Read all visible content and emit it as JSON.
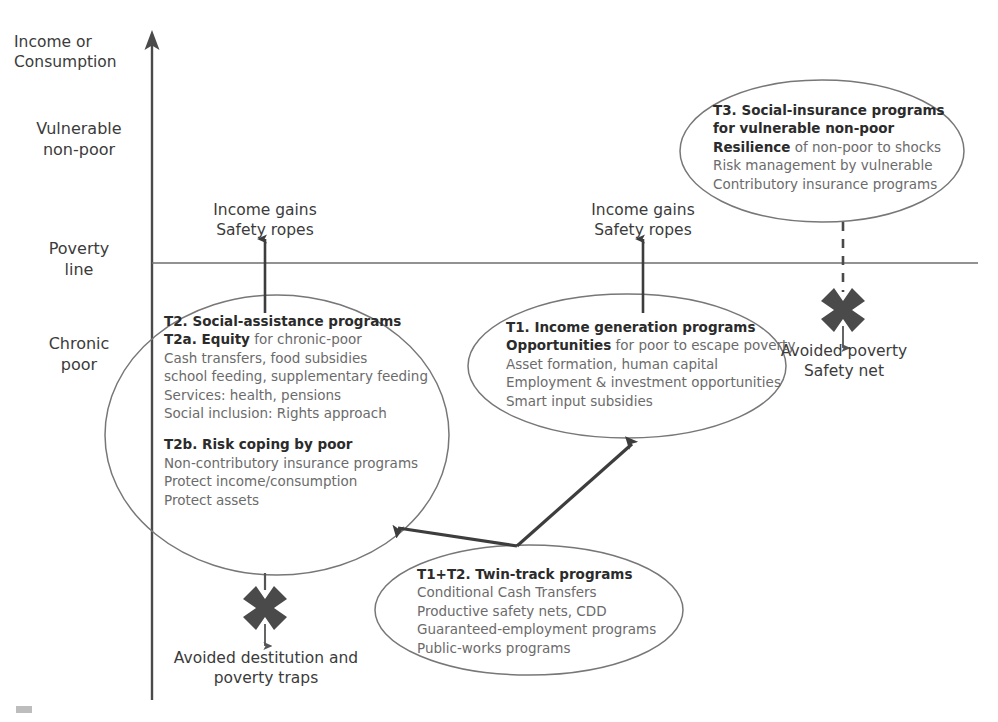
{
  "axis": {
    "y_title": "Income or\nConsumption",
    "categories": [
      {
        "label": "Vulnerable\nnon-poor"
      },
      {
        "label": "Poverty\nline"
      },
      {
        "label": "Chronic\npoor"
      }
    ]
  },
  "flow_labels": {
    "left_gain": "Income gains\nSafety ropes",
    "right_gain": "Income gains\nSafety ropes",
    "avoided_poverty": "Avoided poverty\nSafety net",
    "avoided_destitution": "Avoided destitution and\npoverty traps"
  },
  "ellipses": {
    "t2": {
      "name": "T2 social assistance",
      "lines": [
        {
          "bold": "T2. Social-assistance programs",
          "rest": ""
        },
        {
          "bold": "T2a. Equity",
          "rest": " for chronic-poor"
        },
        {
          "bold": "",
          "rest": "Cash transfers, food subsidies"
        },
        {
          "bold": "",
          "rest": "school feeding, supplementary feeding"
        },
        {
          "bold": "",
          "rest": "Services: health, pensions"
        },
        {
          "bold": "",
          "rest": "Social inclusion: Rights approach"
        },
        {
          "bold": "",
          "rest": "",
          "spacer": true
        },
        {
          "bold": "T2b. Risk coping by poor",
          "rest": ""
        },
        {
          "bold": "",
          "rest": "Non-contributory insurance programs"
        },
        {
          "bold": "",
          "rest": "Protect income/consumption"
        },
        {
          "bold": "",
          "rest": "Protect assets"
        }
      ]
    },
    "t1": {
      "name": "T1 income generation",
      "lines": [
        {
          "bold": "T1. Income generation programs",
          "rest": ""
        },
        {
          "bold": "Opportunities",
          "rest": " for poor to escape poverty"
        },
        {
          "bold": "",
          "rest": "Asset formation, human capital"
        },
        {
          "bold": "",
          "rest": "Employment & investment opportunities"
        },
        {
          "bold": "",
          "rest": "Smart input subsidies"
        }
      ]
    },
    "t3": {
      "name": "T3 social insurance",
      "lines": [
        {
          "bold": "T3. Social-insurance programs",
          "rest": ""
        },
        {
          "bold": "for vulnerable non-poor",
          "rest": ""
        },
        {
          "bold": "Resilience",
          "rest": " of non-poor to shocks"
        },
        {
          "bold": "",
          "rest": "Risk management by vulnerable"
        },
        {
          "bold": "",
          "rest": "Contributory insurance programs"
        }
      ]
    },
    "twin": {
      "name": "T1+T2 twin track",
      "lines": [
        {
          "bold": "T1+T2. Twin-track programs",
          "rest": ""
        },
        {
          "bold": "",
          "rest": "Conditional Cash Transfers"
        },
        {
          "bold": "",
          "rest": "Productive safety nets, CDD"
        },
        {
          "bold": "",
          "rest": "Guaranteed-employment programs"
        },
        {
          "bold": "",
          "rest": "Public-works programs"
        }
      ]
    }
  },
  "colors": {
    "axis": "#4a4a4a",
    "poverty_line": "#6e6e6e",
    "ellipse_stroke": "#777777",
    "arrow": "#3d3d3d",
    "x_mark": "#4a4a4a",
    "body_text": "#6b6b6b",
    "heading_text": "#2b2b2b",
    "label_text": "#3b3b3b",
    "background": "#ffffff"
  }
}
